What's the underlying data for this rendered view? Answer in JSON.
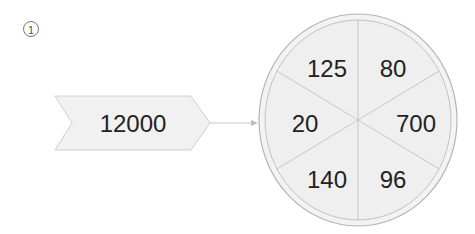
{
  "problem_marker": "①",
  "input": {
    "value": "12000"
  },
  "wheel": {
    "segments": [
      {
        "position": "top-left",
        "value": "125"
      },
      {
        "position": "top-right",
        "value": "80"
      },
      {
        "position": "right",
        "value": "700"
      },
      {
        "position": "bottom-right",
        "value": "96"
      },
      {
        "position": "bottom-left",
        "value": "140"
      },
      {
        "position": "left",
        "value": "20"
      }
    ]
  },
  "colors": {
    "fill": "#f1f1f1",
    "stroke": "#b8b8b8",
    "text": "#222222"
  }
}
